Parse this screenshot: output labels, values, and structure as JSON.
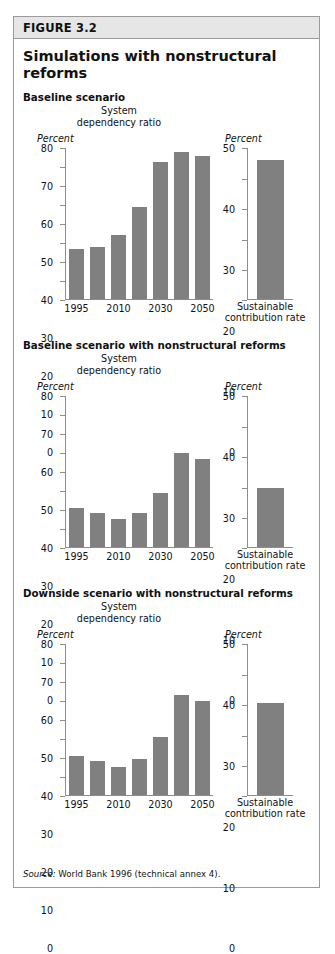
{
  "figure": {
    "label": "FIGURE 3.2",
    "title": "Simulations with nonstructural reforms",
    "source_word": "Source:",
    "source_text": " World Bank 1996 (technical annex 4).",
    "bar_color": "#808080",
    "header_bg": "#e6e6e6",
    "border_color": "#9a9a9a"
  },
  "chart_data": [
    {
      "type": "bar",
      "title": "Baseline scenario",
      "subtitle": "System dependency ratio",
      "ylabel": "Percent",
      "xlabel": "",
      "categories": [
        "1995",
        "2000",
        "2010",
        "2020",
        "2030",
        "2040",
        "2050"
      ],
      "tick_labels": [
        "1995",
        "2010",
        "2030",
        "2050"
      ],
      "tick_label_positions": [
        0,
        2,
        4,
        6
      ],
      "values": [
        26.5,
        27.5,
        34,
        49,
        73,
        78,
        76
      ],
      "ylim": [
        0,
        80
      ],
      "yticks": [
        0,
        10,
        20,
        30,
        40,
        50,
        60,
        70,
        80
      ],
      "grid": false,
      "legend": "none"
    },
    {
      "type": "bar",
      "title": "Baseline scenario sustainable contribution rate",
      "subtitle": "",
      "ylabel": "Percent",
      "categories": [
        "Sustainable contribution rate"
      ],
      "caption_line1": "Sustainable",
      "caption_line2": "contribution rate",
      "values": [
        46
      ],
      "ylim": [
        0,
        50
      ],
      "yticks": [
        0,
        10,
        20,
        30,
        40,
        50
      ],
      "grid": false,
      "legend": "none"
    },
    {
      "type": "bar",
      "title": "Baseline scenario with nonstructural reforms",
      "subtitle": "System dependency ratio",
      "ylabel": "Percent",
      "xlabel": "",
      "categories": [
        "1995",
        "2000",
        "2010",
        "2020",
        "2030",
        "2040",
        "2050"
      ],
      "tick_labels": [
        "1995",
        "2010",
        "2030",
        "2050"
      ],
      "tick_label_positions": [
        0,
        2,
        4,
        6
      ],
      "values": [
        21,
        18,
        15,
        18,
        29,
        50,
        47
      ],
      "ylim": [
        0,
        80
      ],
      "yticks": [
        0,
        10,
        20,
        30,
        40,
        50,
        60,
        70,
        80
      ],
      "grid": false,
      "legend": "none"
    },
    {
      "type": "bar",
      "title": "Baseline scenario with nonstructural reforms sustainable contribution rate",
      "subtitle": "",
      "ylabel": "Percent",
      "categories": [
        "Sustainable contribution rate"
      ],
      "caption_line1": "Sustainable",
      "caption_line2": "contribution rate",
      "values": [
        19.5
      ],
      "ylim": [
        0,
        50
      ],
      "yticks": [
        0,
        10,
        20,
        30,
        40,
        50
      ],
      "grid": false,
      "legend": "none"
    },
    {
      "type": "bar",
      "title": "Downside scenario with nonstructural reforms",
      "subtitle": "System dependency ratio",
      "ylabel": "Percent",
      "xlabel": "",
      "categories": [
        "1995",
        "2000",
        "2010",
        "2020",
        "2030",
        "2040",
        "2050"
      ],
      "tick_labels": [
        "1995",
        "2010",
        "2030",
        "2050"
      ],
      "tick_label_positions": [
        0,
        2,
        4,
        6
      ],
      "values": [
        21,
        18,
        15,
        19,
        31,
        53,
        50
      ],
      "ylim": [
        0,
        80
      ],
      "yticks": [
        0,
        10,
        20,
        30,
        40,
        50,
        60,
        70,
        80
      ],
      "grid": false,
      "legend": "none"
    },
    {
      "type": "bar",
      "title": "Downside scenario with nonstructural reforms sustainable contribution rate",
      "subtitle": "",
      "ylabel": "Percent",
      "categories": [
        "Sustainable contribution rate"
      ],
      "caption_line1": "Sustainable",
      "caption_line2": "contribution rate",
      "values": [
        30.5
      ],
      "ylim": [
        0,
        50
      ],
      "yticks": [
        0,
        10,
        20,
        30,
        40,
        50
      ],
      "grid": false,
      "legend": "none"
    }
  ],
  "panels": [
    {
      "heading": "Baseline scenario",
      "subtitle_line1": "System",
      "subtitle_line2": "dependency ratio",
      "unit_left": "Percent",
      "unit_right": "Percent",
      "main_index": 0,
      "side_index": 1
    },
    {
      "heading": "Baseline scenario with nonstructural reforms",
      "subtitle_line1": "System",
      "subtitle_line2": "dependency ratio",
      "unit_left": "Percent",
      "unit_right": "Percent",
      "main_index": 2,
      "side_index": 3
    },
    {
      "heading": "Downside scenario with nonstructural reforms",
      "subtitle_line1": "System",
      "subtitle_line2": "dependency ratio",
      "unit_left": "Percent",
      "unit_right": "Percent",
      "main_index": 4,
      "side_index": 5
    }
  ]
}
